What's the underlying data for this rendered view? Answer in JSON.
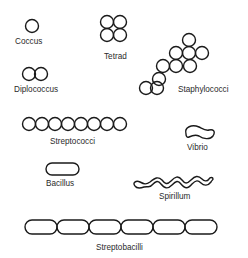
{
  "diagram": {
    "background": "#ffffff",
    "stroke_color": "#1a1a1a",
    "labels": {
      "coccus": "Coccus",
      "tetrad": "Tetrad",
      "diplococcus": "Diplococcus",
      "staphylococci": "Staphylococci",
      "streptococci": "Streptococci",
      "vibrio": "Vibrio",
      "bacillus": "Bacillus",
      "spirillum": "Spirillum",
      "streptobacilli": "Streptobacilli"
    }
  }
}
